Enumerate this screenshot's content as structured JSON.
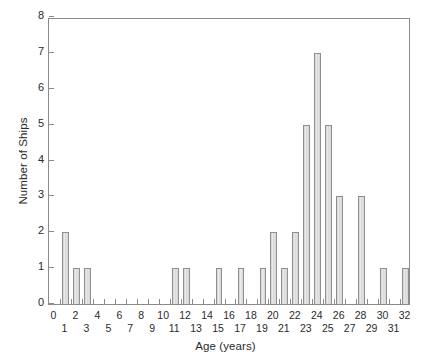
{
  "chart_data": {
    "type": "bar",
    "title": "",
    "subtitle": "",
    "xlabel": "Age (years)",
    "ylabel": "Number of Ships",
    "xlim": [
      -0.5,
      32.5
    ],
    "ylim": [
      0,
      8
    ],
    "grid": false,
    "legend": null,
    "bar_fill_color": "#d9d9d9",
    "bar_edge_color": "#8f8f8f",
    "axis_color": "#8a8a8a",
    "categories": [
      0,
      1,
      2,
      3,
      4,
      5,
      6,
      7,
      8,
      9,
      10,
      11,
      12,
      13,
      14,
      15,
      16,
      17,
      18,
      19,
      20,
      21,
      22,
      23,
      24,
      25,
      26,
      27,
      28,
      29,
      30,
      31,
      32
    ],
    "values": [
      0,
      2,
      1,
      1,
      0,
      0,
      0,
      0,
      0,
      0,
      0,
      1,
      1,
      0,
      0,
      1,
      0,
      1,
      0,
      1,
      2,
      1,
      2,
      5,
      7,
      5,
      3,
      0,
      3,
      0,
      1,
      0,
      1
    ],
    "x_tick_labels": [
      "0",
      "1",
      "2",
      "3",
      "4",
      "5",
      "6",
      "7",
      "8",
      "9",
      "10",
      "11",
      "12",
      "13",
      "14",
      "15",
      "16",
      "17",
      "18",
      "19",
      "20",
      "21",
      "22",
      "23",
      "24",
      "25",
      "26",
      "27",
      "28",
      "29",
      "30",
      "31",
      "32"
    ],
    "y_tick_labels": [
      "0",
      "1",
      "2",
      "3",
      "4",
      "5",
      "6",
      "7",
      "8"
    ],
    "y_ticks": [
      0,
      1,
      2,
      3,
      4,
      5,
      6,
      7,
      8
    ]
  }
}
